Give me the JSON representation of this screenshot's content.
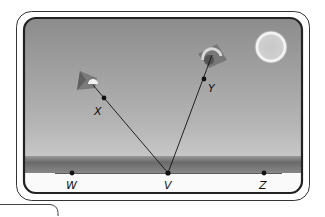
{
  "diagram": {
    "type": "kite-angle-scene",
    "colors": {
      "sky_top": "#8a8a8a",
      "sky_bottom": "#c4c4c4",
      "ground_band": "#6e6e6e",
      "ground_white": "#fafafa",
      "frame": "#222222",
      "line": "#111111",
      "sun_glow": "#f2f2f2"
    },
    "points": [
      {
        "label": "W",
        "x": 72,
        "y": 173
      },
      {
        "label": "V",
        "x": 168,
        "y": 173
      },
      {
        "label": "Z",
        "x": 264,
        "y": 173
      },
      {
        "label": "X",
        "x": 104,
        "y": 98
      },
      {
        "label": "Y",
        "x": 204,
        "y": 79
      }
    ],
    "rays": [
      {
        "from": "V",
        "to": "X",
        "extends_to_kite": true
      },
      {
        "from": "V",
        "to": "Y",
        "extends_to_kite": true
      }
    ],
    "baseline": {
      "from": "W",
      "to": "Z"
    },
    "kites": [
      {
        "name": "left-kite",
        "near_point": "X"
      },
      {
        "name": "right-kite",
        "near_point": "Y"
      }
    ],
    "sun": {
      "present": true
    }
  }
}
